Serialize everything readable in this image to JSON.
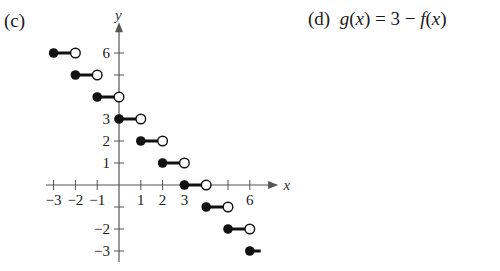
{
  "panel_c": {
    "label": "(c)"
  },
  "panel_d": {
    "label": "(d)",
    "equation_fn": "g",
    "equation_var": "x",
    "equation_rhs_const": "3",
    "equation_rhs_fn": "f"
  },
  "chart_data": {
    "type": "step",
    "title": "(c)",
    "xlabel": "x",
    "ylabel": "y",
    "x_tick_labels": [
      "-3",
      "-2",
      "-1",
      "1",
      "2",
      "3",
      "6"
    ],
    "x_ticks": [
      -3,
      -2,
      -1,
      1,
      2,
      3,
      4,
      5,
      6
    ],
    "y_tick_labels": [
      "6",
      "3",
      "2",
      "1",
      "-2",
      "-3"
    ],
    "y_ticks": [
      6,
      5,
      4,
      3,
      2,
      1,
      -1,
      -2,
      -3
    ],
    "xlim": [
      -3.5,
      7
    ],
    "ylim": [
      -3.5,
      7
    ],
    "grid": false,
    "segments": [
      {
        "x_start": -3,
        "x_end": -2,
        "y": 6,
        "closed_start": true,
        "open_end": true
      },
      {
        "x_start": -2,
        "x_end": -1,
        "y": 5,
        "closed_start": true,
        "open_end": true
      },
      {
        "x_start": -1,
        "x_end": 0,
        "y": 4,
        "closed_start": true,
        "open_end": true
      },
      {
        "x_start": 0,
        "x_end": 1,
        "y": 3,
        "closed_start": true,
        "open_end": true
      },
      {
        "x_start": 1,
        "x_end": 2,
        "y": 2,
        "closed_start": true,
        "open_end": true
      },
      {
        "x_start": 2,
        "x_end": 3,
        "y": 1,
        "closed_start": true,
        "open_end": true
      },
      {
        "x_start": 3,
        "x_end": 4,
        "y": 0,
        "closed_start": true,
        "open_end": true
      },
      {
        "x_start": 4,
        "x_end": 5,
        "y": -1,
        "closed_start": true,
        "open_end": true
      },
      {
        "x_start": 5,
        "x_end": 6,
        "y": -2,
        "closed_start": true,
        "open_end": true
      },
      {
        "x_start": 6,
        "x_end": 6.5,
        "y": -3,
        "closed_start": true,
        "open_end": false
      }
    ]
  }
}
